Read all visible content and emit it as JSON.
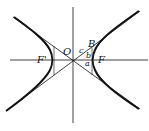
{
  "diagram": {
    "labels": {
      "origin": "O",
      "focus_left": "F'",
      "focus_right": "F",
      "point_b": "B",
      "c": "c",
      "b": "b",
      "a": "a"
    },
    "colors": {
      "stroke": "#111111",
      "background": "#ffffff"
    }
  }
}
